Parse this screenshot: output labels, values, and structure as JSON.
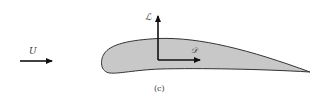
{
  "diagram": {
    "type": "airfoil-forces",
    "caption": "(c)",
    "freestream": {
      "label": "U",
      "direction": "right"
    },
    "lift": {
      "label": "ℒ",
      "direction": "up"
    },
    "drag": {
      "label": "ᵉD",
      "display": "𝒟",
      "direction": "right"
    },
    "colors": {
      "airfoil_fill": "#c8c8c8",
      "airfoil_stroke": "#333333",
      "arrow": "#111111",
      "text": "#333333",
      "background": "#ffffff"
    }
  },
  "labels": {
    "u": "U",
    "lift": "ℒ",
    "drag": "𝒟",
    "caption": "(c)"
  }
}
